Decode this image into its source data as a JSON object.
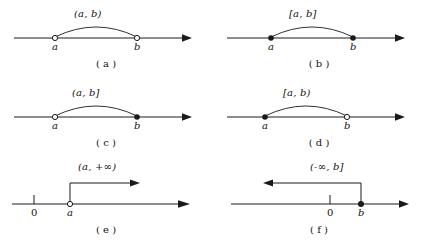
{
  "figure": {
    "title": "",
    "background_color": "#ffffff",
    "line_color": "#1a1a1a",
    "panels": [
      {
        "id": "a",
        "caption": "( a )",
        "interval_label": "(a, b)",
        "interval_type": "open",
        "left_endpoint": {
          "label": "a",
          "marker": "open-circle"
        },
        "right_endpoint": {
          "label": "b",
          "marker": "open-circle"
        },
        "axis_arrow": "right",
        "has_zero_tick": false,
        "zero_label": ""
      },
      {
        "id": "b",
        "caption": "( b )",
        "interval_label": "[a, b]",
        "interval_type": "closed",
        "left_endpoint": {
          "label": "a",
          "marker": "filled-dot"
        },
        "right_endpoint": {
          "label": "b",
          "marker": "filled-dot"
        },
        "axis_arrow": "right",
        "has_zero_tick": false,
        "zero_label": ""
      },
      {
        "id": "c",
        "caption": "( c )",
        "interval_label": "(a, b]",
        "interval_type": "half-open-left",
        "left_endpoint": {
          "label": "a",
          "marker": "open-circle"
        },
        "right_endpoint": {
          "label": "b",
          "marker": "filled-dot"
        },
        "axis_arrow": "right",
        "has_zero_tick": false,
        "zero_label": ""
      },
      {
        "id": "d",
        "caption": "( d )",
        "interval_label": "[a, b)",
        "interval_type": "half-open-right",
        "left_endpoint": {
          "label": "a",
          "marker": "filled-dot"
        },
        "right_endpoint": {
          "label": "b",
          "marker": "open-circle"
        },
        "axis_arrow": "right",
        "has_zero_tick": false,
        "zero_label": ""
      },
      {
        "id": "e",
        "caption": "( e )",
        "interval_label": "(a, +∞)",
        "interval_type": "ray-right-open",
        "left_endpoint": {
          "label": "a",
          "marker": "open-circle"
        },
        "right_endpoint": {
          "label": "",
          "marker": "none"
        },
        "axis_arrow": "right",
        "has_zero_tick": true,
        "zero_label": "0"
      },
      {
        "id": "f",
        "caption": "( f )",
        "interval_label": "(-∞, b]",
        "interval_type": "ray-left-closed",
        "left_endpoint": {
          "label": "",
          "marker": "none"
        },
        "right_endpoint": {
          "label": "b",
          "marker": "filled-dot"
        },
        "axis_arrow": "right",
        "has_zero_tick": true,
        "zero_label": "0"
      }
    ]
  }
}
